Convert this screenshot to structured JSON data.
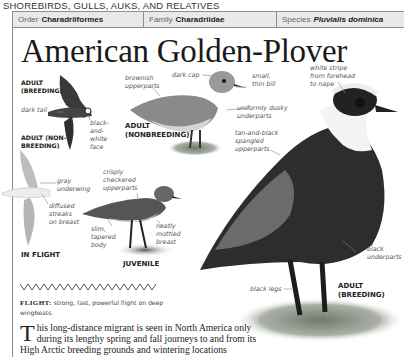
{
  "section": {
    "title": "SHOREBIRDS, GULLS, AUKS, AND RELATIVES"
  },
  "taxonomy": [
    {
      "label": "Order",
      "value": "Charadriiformes",
      "italic": false
    },
    {
      "label": "Family",
      "value": "Charadriidae",
      "italic": false
    },
    {
      "label": "Species",
      "value": "Pluvialis dominica",
      "italic": true
    }
  ],
  "species_title": "American Golden-Plover",
  "captions": {
    "adult_breeding_flight": "ADULT\n(BREEDING)",
    "adult_nonbreeding_flight": "ADULT (NON-\nBREEDING)",
    "in_flight": "IN FLIGHT",
    "adult_nonbreeding": "ADULT\n(NONBREEDING)",
    "juvenile": "JUVENILE",
    "adult_breeding": "ADULT\n(BREEDING)"
  },
  "annotations": {
    "dark_tail": "dark tail",
    "black_white_face": "black-\nand-\nwhite\nface",
    "gray_underwing": "gray\nunderwing",
    "diffused_streaks": "diffused\nstreaks\non breast",
    "brownish_upperparts": "brownish\nupperparts",
    "dark_cap": "dark cap",
    "small_thin_bill": "small,\nthin bill",
    "uniformly_dusky": "uniformly dusky\nunderparts",
    "tan_black_spangled": "tan-and-black\nspangled\nupperparts",
    "crisply_checkered": "crisply\ncheckered\nupperparts",
    "slim_tapered": "slim,\ntapered\nbody",
    "neatly_mottled": "neatly\nmottled\nbreast",
    "white_stripe": "white stripe\nfrom forehead\nto nape",
    "black_underparts": "black\nunderparts",
    "black_legs": "black legs"
  },
  "flight": {
    "label": "FLIGHT:",
    "text": " strong, fast, powerful flight on deep wingbeats."
  },
  "description": {
    "dropcap": "T",
    "text": "his long-distance migrant is seen in North America only during its lengthy spring and fall journeys to and from its High Arctic breeding grounds and wintering locations"
  }
}
